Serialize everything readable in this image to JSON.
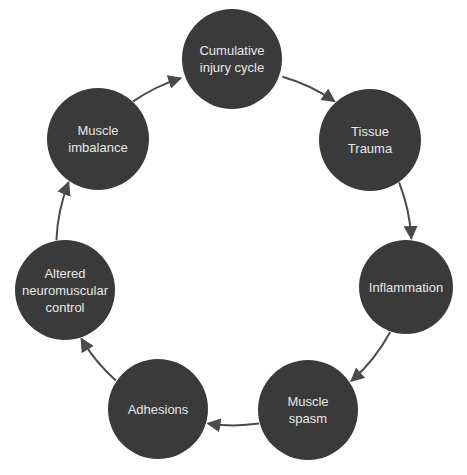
{
  "diagram": {
    "type": "cycle",
    "colors": {
      "node_fill": "#3a3a3a",
      "node_text": "#e8e8e8",
      "arrow": "#4a4a4a",
      "background": "#ffffff"
    },
    "nodes": [
      {
        "label": "Cumulative\ninjury cycle",
        "cx": 232,
        "cy": 59,
        "r": 50
      },
      {
        "label": "Tissue\nTrauma",
        "cx": 370,
        "cy": 140,
        "r": 51
      },
      {
        "label": "Inflammation",
        "cx": 406,
        "cy": 287,
        "r": 47
      },
      {
        "label": "Muscle\nspasm",
        "cx": 308,
        "cy": 410,
        "r": 50
      },
      {
        "label": "Adhesions",
        "cx": 158,
        "cy": 409,
        "r": 50
      },
      {
        "label": "Altered\nneuromuscular\ncontrol",
        "cx": 65,
        "cy": 290,
        "r": 50
      },
      {
        "label": "Muscle\nimbalance",
        "cx": 98,
        "cy": 139,
        "r": 51
      }
    ],
    "edges": [
      {
        "from": 0,
        "to": 1
      },
      {
        "from": 1,
        "to": 2
      },
      {
        "from": 2,
        "to": 3
      },
      {
        "from": 3,
        "to": 4
      },
      {
        "from": 4,
        "to": 5
      },
      {
        "from": 5,
        "to": 6
      },
      {
        "from": 6,
        "to": 0
      }
    ]
  }
}
